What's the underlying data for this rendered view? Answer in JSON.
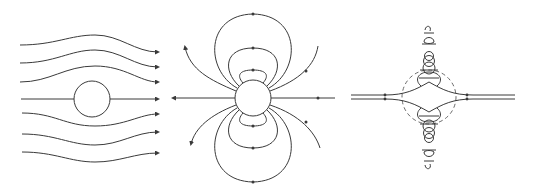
{
  "figure": {
    "panels": [
      {
        "id": "uniform-flow-past-sphere",
        "description": "streamlines of uniform flow deflected around a sphere, arrows pointing right"
      },
      {
        "id": "dipole-field-around-sphere",
        "description": "closed dipole-like field loops around sphere, axial lines with arrows pointing left"
      },
      {
        "id": "combined-flow-with-dashed-boundary",
        "description": "axial flow lines with looping trajectories above and below, dashed circular boundary"
      }
    ],
    "colors": {
      "line": "#3a3a3a",
      "dashed": "#6a6a6a",
      "background": "#ffffff"
    }
  }
}
